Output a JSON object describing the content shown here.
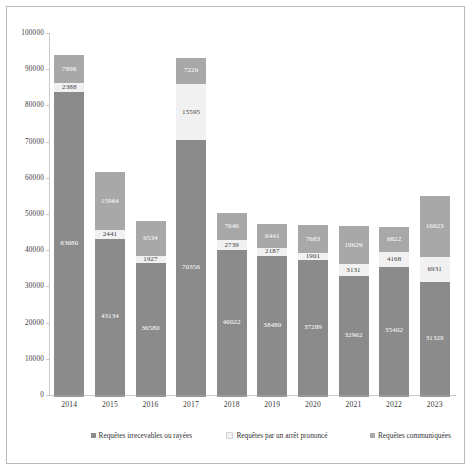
{
  "chart_data": {
    "type": "bar",
    "subtype": "stacked-bar",
    "title": "",
    "xlabel": "",
    "ylabel": "",
    "ylim": [
      0,
      100000
    ],
    "ytick_step": 10000,
    "ytick_labels": [
      "100000",
      "90000",
      "80000",
      "70000",
      "60000",
      "50000",
      "40000",
      "30000",
      "20000",
      "10000",
      "0"
    ],
    "grid": false,
    "legend_position": "bottom",
    "categories": [
      "2014",
      "2015",
      "2016",
      "2017",
      "2018",
      "2019",
      "2020",
      "2021",
      "2022",
      "2023"
    ],
    "series": [
      {
        "name": "Requêtes irrecevables ou rayées",
        "color": "#8b8b8b",
        "values": [
          83680,
          43134,
          36580,
          70356,
          40022,
          38480,
          37289,
          32962,
          35402,
          31329
        ]
      },
      {
        "name": "Requêtes par un arrêt prononcé",
        "color": "#f1f1f1",
        "values": [
          2388,
          2441,
          1927,
          15595,
          2739,
          2187,
          1901,
          3131,
          4168,
          6931
        ]
      },
      {
        "name": "Requêtes communiquées",
        "color": "#a8a8a8",
        "values": [
          7896,
          15964,
          9534,
          7226,
          7646,
          6441,
          7683,
          10629,
          6822,
          16623
        ]
      }
    ]
  },
  "legend": {
    "items": [
      {
        "label": "Requêtes irrecevables ou rayées"
      },
      {
        "label": "Requêtes par un arrêt prononcé"
      },
      {
        "label": "Requêtes communiquées"
      }
    ]
  }
}
